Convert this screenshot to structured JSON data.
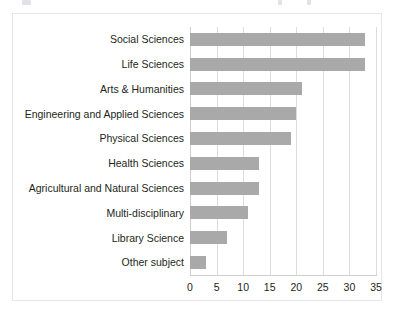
{
  "figure": {
    "background_color": "#ffffff",
    "frame_color": "#e6e6e6",
    "caption_remnant_present": true
  },
  "chart_data": {
    "type": "bar",
    "orientation": "horizontal",
    "title": "",
    "subtitle": "",
    "xlabel": "",
    "ylabel": "",
    "categories": [
      "Social Sciences",
      "Life Sciences",
      "Arts & Humanities",
      "Engineering and Applied Sciences",
      "Physical Sciences",
      "Health Sciences",
      "Agricultural and Natural Sciences",
      "Multi-disciplinary",
      "Library Science",
      "Other subject"
    ],
    "values": [
      33,
      33,
      21,
      20,
      19,
      13,
      13,
      11,
      7,
      3
    ],
    "xlim": [
      0,
      35
    ],
    "xticks": [
      0,
      5,
      10,
      15,
      20,
      25,
      30,
      35
    ],
    "xticklabels": [
      "0",
      "5",
      "10",
      "15",
      "20",
      "25",
      "30",
      "35"
    ],
    "grid": "vertical",
    "legend": "none",
    "bar_color": "#a9a9a9",
    "gridline_color": "#dddddd",
    "axis_color": "#cfcfcf",
    "label_color": "#231f20"
  }
}
